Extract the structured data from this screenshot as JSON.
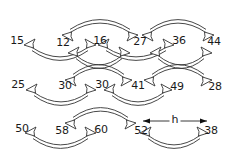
{
  "diagram": {
    "type": "number-sequence-arrows",
    "rows": [
      {
        "numbers": [
          {
            "value": "15",
            "x": 17,
            "y": 40
          },
          {
            "value": "12",
            "x": 63,
            "y": 42
          },
          {
            "value": "16",
            "x": 100,
            "y": 40
          },
          {
            "value": "27",
            "x": 140,
            "y": 41
          },
          {
            "value": "36",
            "x": 179,
            "y": 40
          },
          {
            "value": "44",
            "x": 214,
            "y": 41
          }
        ]
      },
      {
        "numbers": [
          {
            "value": "25",
            "x": 18,
            "y": 84
          },
          {
            "value": "30",
            "x": 65,
            "y": 85
          },
          {
            "value": "30",
            "x": 102,
            "y": 84
          },
          {
            "value": "41",
            "x": 138,
            "y": 85
          },
          {
            "value": "49",
            "x": 177,
            "y": 86
          },
          {
            "value": "28",
            "x": 215,
            "y": 86
          }
        ]
      },
      {
        "numbers": [
          {
            "value": "50",
            "x": 22,
            "y": 128
          },
          {
            "value": "58",
            "x": 62,
            "y": 130
          },
          {
            "value": "60",
            "x": 101,
            "y": 129
          },
          {
            "value": "52",
            "x": 141,
            "y": 130
          },
          {
            "value": "38",
            "x": 211,
            "y": 130
          }
        ]
      }
    ],
    "arrows": [
      {
        "from": "12",
        "to": "27",
        "side": "above",
        "x1": 62,
        "x2": 138,
        "y": 31
      },
      {
        "from": "27",
        "to": "44",
        "side": "above",
        "x1": 142,
        "x2": 214,
        "y": 31
      },
      {
        "from": "15",
        "to": "16",
        "side": "below",
        "x1": 24,
        "x2": 96,
        "y": 49
      },
      {
        "from": "16",
        "to": "36",
        "side": "below",
        "x1": 98,
        "x2": 174,
        "y": 49
      },
      {
        "from": "16",
        "to": "41",
        "side": "below-long",
        "x1": 68,
        "x2": 130,
        "y": 57
      },
      {
        "from": "30",
        "to": "41",
        "side": "above",
        "x1": 65,
        "x2": 132,
        "y": 76
      },
      {
        "from": "41",
        "to": "28",
        "side": "above",
        "x1": 144,
        "x2": 212,
        "y": 76
      },
      {
        "from": "36",
        "to": "49",
        "side": "below-long",
        "x1": 150,
        "x2": 212,
        "y": 57
      },
      {
        "from": "25",
        "to": "30",
        "side": "below",
        "x1": 26,
        "x2": 96,
        "y": 94
      },
      {
        "from": "30",
        "to": "49",
        "side": "below",
        "x1": 104,
        "x2": 172,
        "y": 94
      },
      {
        "from": "58",
        "to": "52",
        "side": "above",
        "x1": 65,
        "x2": 136,
        "y": 119
      },
      {
        "from": "50",
        "to": "60",
        "side": "below",
        "x1": 25,
        "x2": 96,
        "y": 137
      },
      {
        "from": "52",
        "to": "38",
        "side": "below",
        "x1": 140,
        "x2": 208,
        "y": 137
      }
    ],
    "measure": {
      "label": "h",
      "from": "52",
      "to": "38",
      "x1": 143,
      "x2": 207,
      "y": 121
    }
  }
}
